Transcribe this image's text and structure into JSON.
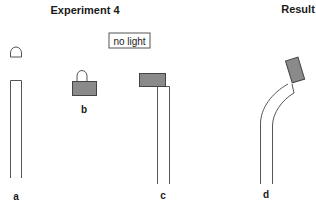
{
  "titles": {
    "experiment": "Experiment 4",
    "result": "Result"
  },
  "condition_box": {
    "text": "no light"
  },
  "panels": [
    {
      "id": "a",
      "label": "a",
      "description": "seedling tip removed, cap separated above stem"
    },
    {
      "id": "b",
      "label": "b",
      "description": "cut tip placed on block"
    },
    {
      "id": "c",
      "label": "c",
      "description": "block placed off-center on stem top"
    },
    {
      "id": "d",
      "label": "d",
      "description": "stem bends away from block side"
    }
  ],
  "colors": {
    "block_fill": "#8a8a8a",
    "outline": "#555555",
    "text": "#1a1a1a",
    "background": "#ffffff"
  }
}
